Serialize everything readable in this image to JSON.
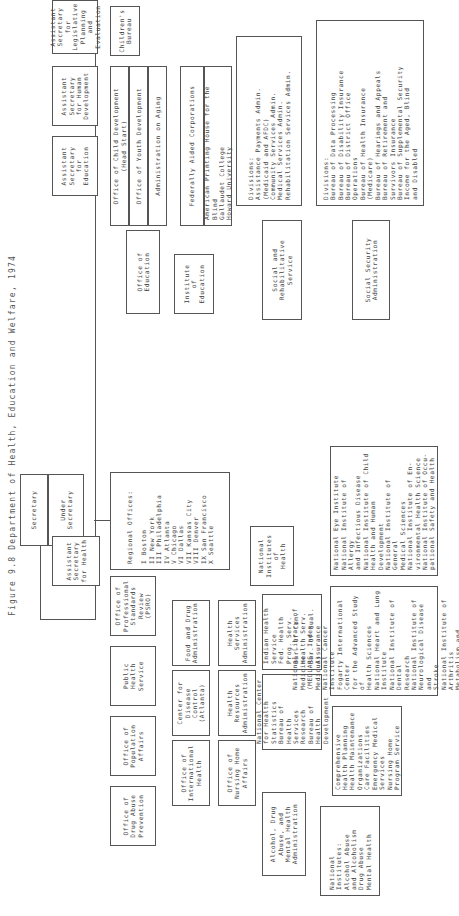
{
  "figure": {
    "title": "Figure 9.8  Department of Health, Education and Welfare, 1974"
  },
  "top": {
    "secretary": "Secretary",
    "under_secretary": "Under\nSecretary",
    "regional_offices": "Regional Offices:\n\n  I    Boston\n  II   New York\n  III  Philadelphia\n  IV   Atlanta\n  V    Chicago\n  VI   Dallas\n  VII  Kansas City\n  VIII Denver\n  IX   San Francisco\n  X    Seattle"
  },
  "assistant_secretaries": [
    {
      "label": "Assistant\nSecretary\nfor Health"
    },
    {
      "label": "Assistant\nSecretary\nfor\nEducation"
    },
    {
      "label": "Assistant\nSecretary\nfor Human\nDevelopment"
    },
    {
      "label": "Assistant\nSecretary\nfor\nLegislative\nPlanning and\nEvaluation"
    },
    {
      "label": "Assistant\nSecretary for\nAdministra-\ntion and\nManagement"
    },
    {
      "label": "Assistant\nfor Public\nAffairs"
    }
  ],
  "human_development": {
    "offices": [
      "Office of Child Development\n(Head Start)",
      "Office of Youth Development",
      "Administration on Aging"
    ],
    "childrens_bureau": "Children's\nBureau"
  },
  "education": {
    "office_of_education": "Office of\nEducation",
    "institute": "Institute\nof\nEducation",
    "federally_aided": "Federally Aided Corporations",
    "federally_aided_list": "American Printing House for the Blind\nGallaudet College\nHoward University"
  },
  "srs": {
    "label": "Social and\nRehabilitative\nService",
    "divisions": "Divisions:\nAssistance Payments Admin.\n  (Medicaid and AFDC)\nCommunity Services Admin.\nMedical Services Admin.\nRehabilitation Services Admin."
  },
  "ssa": {
    "label": "Social Security\nAdministration",
    "divisions": "Divisions:\nBureau of Data Processing\nBureau of Disability Insurance\nBureau of District Office\n  Operations\nBureau of Health Insurance\n  (Medicare)\nBureau of Hearings and Appeals\nBureau of Retirement and\n  Survivors Insurance\nBureau of Supplemental Security\n  Income for the Aged, Blind\n  and Disabled"
  },
  "health": {
    "psro": "Office of\nProfessional\nStandards\nReview (PSRO)",
    "public_health_service": "Public\nHealth\nService",
    "population_affairs": "Office of\nPopulation\nAffairs",
    "drug_abuse": "Office of\nDrug Abuse\nPrevention",
    "international_health": "Office of\nInternational\nHealth",
    "nursing_home": "Office of\nNursing Home\nAffairs",
    "fda": "Food and Drug\nAdministration",
    "cdc": "Center for\nDisease\nControl\n(Atlanta)",
    "hsa": "Health\nServices\nAdministration",
    "hra": "Health\nResources\nAdministration",
    "adamha": "Alcohol, Drug\nAbuse, and\nMental Health\nAdministration",
    "nih": "National\nInstitutes\nof\nHealth",
    "indian_health": "Indian Health\nService\nFed. Health\n  Prog. Serv.\nBur. of Com.\n  Health Serv.\nBur. of Qual.\n  Assurance",
    "nchs": "National Center\nfor Health\nStatistics\nBureau of Health\nServices Research\nBureau of Health\nDevelopment",
    "adamha_institutes": "National\nInstitutes:\nAlcohol Abuse\nand Alcoholism\nDrug Abuse\nMental Health",
    "hsa_programs": "Comprehensive\nHealth Planning\nHealth Maintenance\nOrganizations\nCare Facilities\nEmergency Medical\nServices\nNursing Home\nProgram Service",
    "nih_institutes_1": "National Library of Medicine\n  (MEDLARS, Index Medicus)\nNational Cancer Institute\nFogarty International Center\n  for the Advanced Study of\n  Health Sciences\nNational Heart and Lung\n  Institute\nNational Institute of Dental\n  Research\nNational Institute of\n  Neurological Disease and\n  Stroke\nNational Institute of Arthritis\n  Metabolism and Digestive\n  Disease",
    "nih_institutes_2": "National Eye Institute\nNational Institute of Allergy\n  and Infectious Disease\nNational Institute of Child\n  Health and Human\n  Development\nNational Institute of General\n  Medical Sciences\nNational Institute of En-\n  vironmental Health Science\nNational Institute of Occu-\n  pational Safety and Health"
  }
}
